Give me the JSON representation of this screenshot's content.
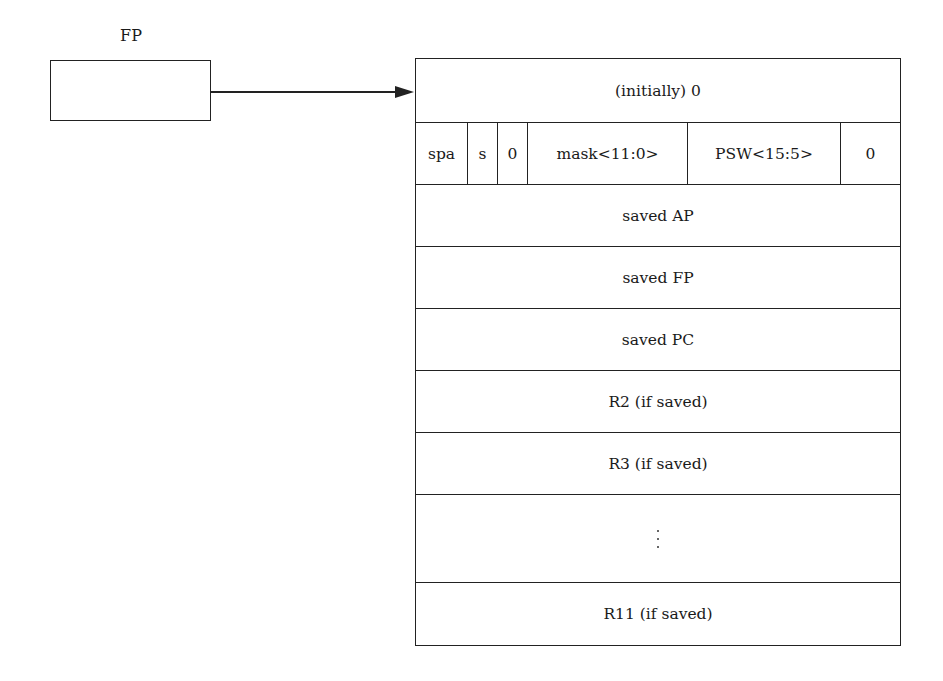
{
  "pointer": {
    "label": "FP"
  },
  "stack": {
    "rows": [
      {
        "type": "single",
        "label": "(initially) 0",
        "height": 64
      },
      {
        "type": "split",
        "height": 62,
        "cells": [
          {
            "label": "spa",
            "width": 52
          },
          {
            "label": "s",
            "width": 30
          },
          {
            "label": "0",
            "width": 30
          },
          {
            "label": "mask<11:0>",
            "width": 160
          },
          {
            "label": "PSW<15:5>",
            "width": 153
          },
          {
            "label": "0",
            "width": 60
          }
        ]
      },
      {
        "type": "single",
        "label": "saved AP",
        "height": 62
      },
      {
        "type": "single",
        "label": "saved FP",
        "height": 62
      },
      {
        "type": "single",
        "label": "saved PC",
        "height": 62
      },
      {
        "type": "single",
        "label": "R2 (if saved)",
        "height": 62
      },
      {
        "type": "single",
        "label": "R3 (if saved)",
        "height": 62
      },
      {
        "type": "ellipsis",
        "label": "⋮",
        "height": 88
      },
      {
        "type": "single",
        "label": "R11 (if saved)",
        "height": 62
      }
    ]
  },
  "colors": {
    "line": "#222222",
    "background": "#ffffff"
  }
}
